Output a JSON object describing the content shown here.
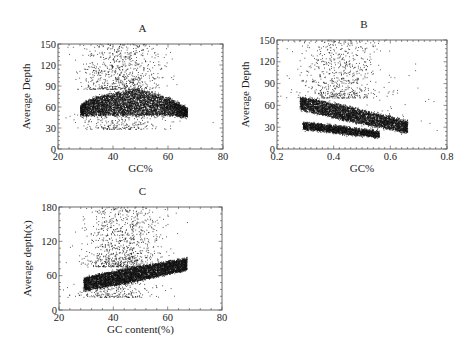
{
  "chart_data": [
    {
      "panel": "A",
      "type": "scatter",
      "title": "A",
      "xlabel": "GC%",
      "ylabel": "Average Depth",
      "xlim": [
        20,
        80
      ],
      "ylim": [
        0,
        150
      ],
      "xticks": [
        20,
        40,
        60,
        80
      ],
      "yticks": [
        0,
        30,
        60,
        90,
        120,
        150
      ],
      "x_minor_step": 4,
      "y_minor_step": 6,
      "grid": false,
      "legend": null,
      "box": {
        "x0": 58,
        "y0": 44,
        "x1": 223,
        "y1": 149
      },
      "clusters": [
        {
          "desc": "dense core",
          "n": 5200,
          "x_range": [
            28,
            67
          ],
          "center_fn": "arch",
          "y_low": 50,
          "y_high_peak": 85,
          "y_high_end": 58,
          "peak_x": 48,
          "sd": 0
        },
        {
          "desc": "sparse high-depth outliers",
          "n": 700,
          "x_mean": 43,
          "x_sd": 7,
          "y_min": 85,
          "y_max": 150
        },
        {
          "desc": "sparse low-depth",
          "n": 250,
          "x_mean": 42,
          "x_sd": 8,
          "y_min": 28,
          "y_max": 52
        }
      ],
      "summary": {
        "dense_gc_range": [
          28,
          67
        ],
        "dense_depth_range": [
          50,
          85
        ],
        "outlier_max_depth": 150
      }
    },
    {
      "panel": "B",
      "type": "scatter",
      "title": "B",
      "xlabel": "GC%",
      "ylabel": "Average Depth",
      "xlim": [
        0.2,
        0.8
      ],
      "ylim": [
        0,
        150
      ],
      "xticks": [
        0.2,
        0.4,
        0.6,
        0.8
      ],
      "yticks": [
        0,
        30,
        60,
        90,
        120,
        150
      ],
      "x_minor_step": 0.02,
      "y_minor_step": 6,
      "grid": false,
      "legend": null,
      "box": {
        "x0": 277,
        "y0": 40,
        "x1": 447,
        "y1": 149
      },
      "clusters": [
        {
          "desc": "upper band",
          "n": 4200,
          "x_range": [
            0.28,
            0.66
          ],
          "y_start": 63,
          "y_end": 30,
          "half_width": 10
        },
        {
          "desc": "lower band",
          "n": 2200,
          "x_range": [
            0.29,
            0.56
          ],
          "y_start": 32,
          "y_end": 20,
          "half_width": 5
        },
        {
          "desc": "sparse high-depth outliers",
          "n": 650,
          "x_mean": 0.42,
          "x_sd": 0.07,
          "y_min": 70,
          "y_max": 150
        },
        {
          "desc": "scattered far points",
          "n": 40,
          "x_mean": 0.62,
          "x_sd": 0.06,
          "y_min": 20,
          "y_max": 110
        }
      ],
      "summary": {
        "upper_band": {
          "from": [
            0.28,
            63
          ],
          "to": [
            0.66,
            30
          ]
        },
        "lower_band": {
          "from": [
            0.29,
            32
          ],
          "to": [
            0.56,
            20
          ]
        }
      }
    },
    {
      "panel": "C",
      "type": "scatter",
      "title": "C",
      "xlabel": "GC content(%)",
      "ylabel": "Average depth(x)",
      "xlim": [
        20,
        80
      ],
      "ylim": [
        0,
        180
      ],
      "xticks": [
        20,
        40,
        60,
        80
      ],
      "yticks": [
        0,
        60,
        120,
        180
      ],
      "x_minor_step": 4,
      "y_minor_step": 12,
      "grid": false,
      "legend": null,
      "box": {
        "x0": 59,
        "y0": 207,
        "x1": 222,
        "y1": 310
      },
      "clusters": [
        {
          "desc": "rising dense band",
          "n": 5200,
          "x_range": [
            29,
            67
          ],
          "y_start": 45,
          "y_end": 80,
          "half_width": 13
        },
        {
          "desc": "sparse high-depth outliers",
          "n": 900,
          "x_mean": 44,
          "x_sd": 7,
          "y_min": 75,
          "y_max": 180
        },
        {
          "desc": "sparse low-depth",
          "n": 250,
          "x_mean": 40,
          "x_sd": 7,
          "y_min": 22,
          "y_max": 48
        }
      ],
      "summary": {
        "band": {
          "from": [
            29,
            45
          ],
          "to": [
            67,
            80
          ]
        },
        "outlier_max_depth": 180
      }
    }
  ]
}
